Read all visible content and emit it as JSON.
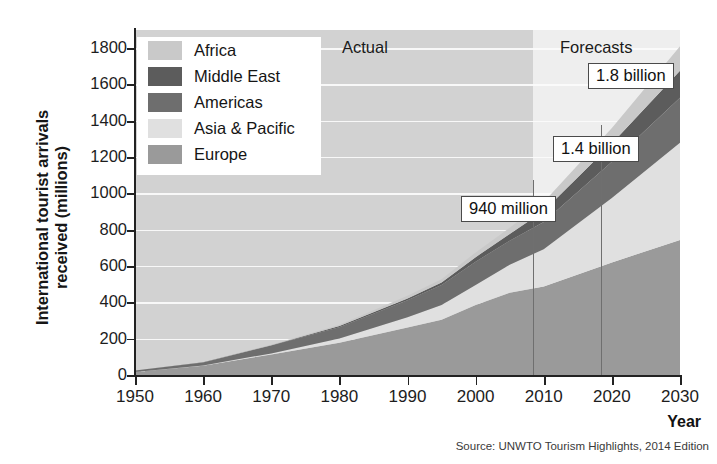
{
  "chart_data": {
    "type": "area",
    "title": "",
    "subtitle": "",
    "xlabel": "Year",
    "ylabel": "International tourist arrivals received (millions)",
    "xlim": [
      1950,
      2030
    ],
    "ylim": [
      0,
      1900
    ],
    "xticks": [
      "1950",
      "1960",
      "1970",
      "1980",
      "1990",
      "2000",
      "2010",
      "2020",
      "2030"
    ],
    "yticks": [
      "0",
      "200",
      "400",
      "600",
      "800",
      "1000",
      "1200",
      "1400",
      "1600",
      "1800"
    ],
    "grid": true,
    "legend_position": "top-left",
    "stacked": true,
    "stack_order_bottom_to_top": [
      "Europe",
      "Asia & Pacific",
      "Americas",
      "Middle East",
      "Africa"
    ],
    "x": [
      1950,
      1960,
      1970,
      1980,
      1990,
      1995,
      2000,
      2005,
      2010,
      2020,
      2030
    ],
    "series": [
      {
        "name": "Europe",
        "color": "#9a9a9a",
        "values": [
          17,
          51,
          113,
          178,
          262,
          304,
          386,
          453,
          488,
          620,
          744
        ]
      },
      {
        "name": "Asia & Pacific",
        "color": "#e0e0e0",
        "values": [
          0.2,
          1,
          6,
          23,
          56,
          82,
          110,
          154,
          205,
          355,
          535
        ]
      },
      {
        "name": "Americas",
        "color": "#6e6e6e",
        "values": [
          7,
          17,
          43,
          62,
          93,
          109,
          128,
          133,
          150,
          199,
          248
        ]
      },
      {
        "name": "Middle East",
        "color": "#5c5c5c",
        "values": [
          0.2,
          0.6,
          2,
          7,
          10,
          14,
          25,
          36,
          60,
          101,
          149
        ]
      },
      {
        "name": "Africa",
        "color": "#c9c9c9",
        "values": [
          0.5,
          1,
          3,
          7,
          15,
          19,
          26,
          35,
          50,
          85,
          134
        ]
      }
    ],
    "totals": [
      25,
      70,
      167,
      277,
      436,
      528,
      675,
      811,
      953,
      1360,
      1810
    ],
    "annotations": [
      {
        "label": "940 million",
        "year": 2010,
        "value": 940
      },
      {
        "label": "1.4 billion",
        "year": 2020,
        "value": 1400
      },
      {
        "label": "1.8 billion",
        "year": 2030,
        "value": 1800
      }
    ],
    "period_bands": [
      {
        "label": "Actual",
        "from": 1950,
        "to": 2010,
        "bg": "#d2d2d2"
      },
      {
        "label": "Forecasts",
        "from": 2010,
        "to": 2030,
        "bg": "#eeeeee"
      }
    ]
  },
  "legend": {
    "items": [
      {
        "label": "Africa",
        "color": "#c9c9c9"
      },
      {
        "label": "Middle East",
        "color": "#5c5c5c"
      },
      {
        "label": "Americas",
        "color": "#6e6e6e"
      },
      {
        "label": "Asia & Pacific",
        "color": "#e0e0e0"
      },
      {
        "label": "Europe",
        "color": "#9a9a9a"
      }
    ]
  },
  "axes": {
    "y_title": "International tourist arrivals received (millions)",
    "y_title_line1": "International tourist arrivals",
    "y_title_line2": "received (millions)",
    "x_title": "Year",
    "y_ticks": [
      "1800",
      "1600",
      "1400",
      "1200",
      "1000",
      "800",
      "600",
      "400",
      "200",
      "0"
    ],
    "x_ticks": [
      "1950",
      "1960",
      "1970",
      "1980",
      "1990",
      "2000",
      "2010",
      "2020",
      "2030"
    ]
  },
  "periods": {
    "actual": "Actual",
    "forecasts": "Forecasts"
  },
  "callouts": {
    "c940": "940 million",
    "c14": "1.4 billion",
    "c18": "1.8 billion"
  },
  "source": {
    "text": "Source: UNWTO Tourism Highlights, 2014 Edition"
  }
}
